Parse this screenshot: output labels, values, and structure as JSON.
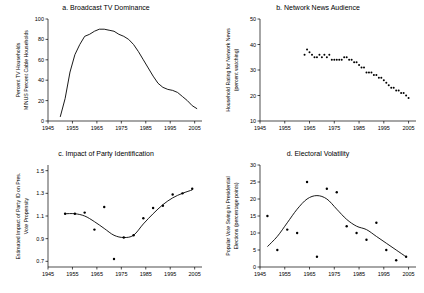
{
  "figure": {
    "background": "#ffffff",
    "ink": "#000000"
  },
  "panels": [
    {
      "id": "a",
      "title": "a. Broadcast TV Dominance",
      "ylabel_line1": "Percent TV Households",
      "ylabel_line2": "MINUS Percent Cable Households",
      "xticks": [
        "1945",
        "1955",
        "1965",
        "1975",
        "1985",
        "1995",
        "2005"
      ],
      "yticks": [
        "0",
        "20",
        "40",
        "60",
        "80",
        "100"
      ]
    },
    {
      "id": "b",
      "title": "b. Network News Audience",
      "ylabel_line1": "Household Rating for Network News",
      "ylabel_line2": "(percent watching)",
      "xticks": [
        "1945",
        "1955",
        "1965",
        "1975",
        "1985",
        "1995",
        "2005"
      ],
      "yticks": [
        "10",
        "20",
        "30",
        "40",
        "50"
      ]
    },
    {
      "id": "c",
      "title": "c. Impact of Party Identification",
      "ylabel_line1": "Estimated Impact of Party ID on Pres.",
      "ylabel_line2": "Vote Propensity",
      "xticks": [
        "1945",
        "1955",
        "1965",
        "1975",
        "1985",
        "1995",
        "2005"
      ],
      "yticks": [
        "0.7",
        "0.9",
        "1.1",
        "1.3",
        "1.5"
      ]
    },
    {
      "id": "d",
      "title": "d. Electoral Volatility",
      "ylabel_line1": "Popular Vote Swing in Presidential",
      "ylabel_line2": "Elections (percentage points)",
      "xticks": [
        "1945",
        "1955",
        "1965",
        "1975",
        "1985",
        "1995",
        "2005"
      ],
      "yticks": [
        "0",
        "5",
        "10",
        "15",
        "20",
        "25",
        "30"
      ]
    }
  ],
  "chart_data": [
    {
      "type": "line",
      "panel": "a",
      "title": "a. Broadcast TV Dominance",
      "xlabel": "",
      "ylabel": "Percent TV Households MINUS Percent Cable Households",
      "xlim": [
        1945,
        2008
      ],
      "ylim": [
        0,
        100
      ],
      "grid": false,
      "legend": "none",
      "x": [
        1950,
        1952,
        1954,
        1956,
        1958,
        1960,
        1962,
        1964,
        1966,
        1968,
        1970,
        1972,
        1974,
        1976,
        1978,
        1980,
        1982,
        1984,
        1986,
        1988,
        1990,
        1992,
        1994,
        1996,
        1998,
        2000,
        2002,
        2004,
        2006
      ],
      "values": [
        4,
        22,
        48,
        65,
        75,
        83,
        85,
        88,
        90,
        90,
        89,
        88,
        85,
        83,
        80,
        75,
        68,
        60,
        52,
        44,
        37,
        33,
        31,
        30,
        28,
        24,
        20,
        15,
        12
      ]
    },
    {
      "type": "scatter",
      "panel": "b",
      "title": "b. Network News Audience",
      "xlabel": "",
      "ylabel": "Household Rating for Network News (percent watching)",
      "xlim": [
        1945,
        2008
      ],
      "ylim": [
        10,
        50
      ],
      "grid": false,
      "legend": "none",
      "x": [
        1963,
        1964,
        1965,
        1966,
        1967,
        1968,
        1969,
        1970,
        1971,
        1972,
        1973,
        1974,
        1975,
        1976,
        1977,
        1978,
        1979,
        1980,
        1981,
        1982,
        1983,
        1984,
        1985,
        1986,
        1987,
        1988,
        1989,
        1990,
        1991,
        1992,
        1993,
        1994,
        1995,
        1996,
        1997,
        1998,
        1999,
        2000,
        2001,
        2002,
        2003,
        2004,
        2005
      ],
      "values": [
        36,
        38,
        37,
        36,
        35,
        35,
        36,
        35,
        36,
        35,
        36,
        34,
        34,
        34,
        34,
        34,
        35,
        35,
        34,
        34,
        33,
        33,
        32,
        31,
        31,
        29,
        29,
        29,
        28,
        28,
        27,
        27,
        26,
        25,
        24,
        23,
        23,
        22,
        22,
        21,
        21,
        20,
        19
      ]
    },
    {
      "type": "scatter-with-fit",
      "panel": "c",
      "title": "c. Impact of Party Identification",
      "xlabel": "",
      "ylabel": "Estimated Impact of Party ID on Pres. Vote Propensity",
      "xlim": [
        1945,
        2008
      ],
      "ylim": [
        0.65,
        1.55
      ],
      "grid": false,
      "legend": "none",
      "x": [
        1952,
        1956,
        1960,
        1964,
        1968,
        1972,
        1976,
        1980,
        1984,
        1988,
        1992,
        1996,
        2000,
        2004
      ],
      "values": [
        1.12,
        1.12,
        1.13,
        0.98,
        1.18,
        0.72,
        0.91,
        0.93,
        1.08,
        1.17,
        1.19,
        1.29,
        1.3,
        1.34
      ],
      "fit_x": [
        1952,
        1956,
        1960,
        1964,
        1968,
        1972,
        1976,
        1980,
        1984,
        1988,
        1992,
        1996,
        2000,
        2004
      ],
      "fit_values": [
        1.12,
        1.12,
        1.1,
        1.05,
        0.99,
        0.93,
        0.91,
        0.93,
        1.03,
        1.12,
        1.2,
        1.26,
        1.3,
        1.33
      ]
    },
    {
      "type": "scatter-with-fit",
      "panel": "d",
      "title": "d. Electoral Volatility",
      "xlabel": "",
      "ylabel": "Popular Vote Swing in Presidential Elections (percentage points)",
      "xlim": [
        1945,
        2008
      ],
      "ylim": [
        0,
        30
      ],
      "grid": false,
      "legend": "none",
      "x": [
        1948,
        1952,
        1956,
        1960,
        1964,
        1968,
        1972,
        1976,
        1980,
        1984,
        1988,
        1992,
        1996,
        2000,
        2004
      ],
      "values": [
        15,
        5,
        11,
        10,
        25,
        3,
        23,
        22,
        12,
        10,
        8,
        13,
        5,
        2,
        3
      ],
      "fit_x": [
        1948,
        1952,
        1956,
        1960,
        1964,
        1968,
        1972,
        1976,
        1980,
        1984,
        1988,
        1992,
        1996,
        2000,
        2004
      ],
      "fit_values": [
        6,
        9,
        13,
        17,
        20,
        21,
        20,
        17,
        14,
        12,
        11,
        9,
        7,
        5,
        3
      ]
    }
  ]
}
